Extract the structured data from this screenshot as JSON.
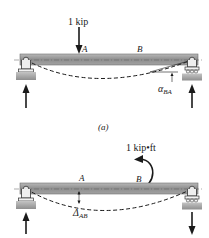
{
  "figure_a": {
    "load_label": "1 kip",
    "point_a": "A",
    "point_b": "B",
    "angle_symbol": "α",
    "angle_subscript": "BA",
    "caption": "(a)"
  },
  "figure_b": {
    "moment_label": "1 kip•ft",
    "point_a": "A",
    "point_b": "B",
    "deflection_symbol": "Δ",
    "deflection_subscript": "AB"
  },
  "colors": {
    "beam_fill": "#9a9a9a",
    "beam_edge": "#6e6e6e",
    "ground": "#a8a8a8",
    "ink": "#1a1a1a"
  }
}
